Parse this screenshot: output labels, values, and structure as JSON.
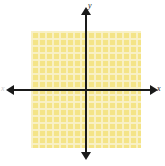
{
  "figure": {
    "title": "",
    "background_color": "#ffffff"
  },
  "axes": {
    "x_label": "x",
    "y_label": "y",
    "x_label_secondary": "x",
    "axis_color": "#1a1a1a",
    "origin_x_px": 86,
    "origin_y_px": 90
  },
  "grid": {
    "cell_size_px": 7,
    "columns": 16,
    "rows": 17,
    "fill_color": "#f7ec9a",
    "line_color": "#ffffff",
    "left_px": 31,
    "top_px": 31,
    "width_px": 110,
    "height_px": 117
  },
  "chart_data": {
    "type": "scatter",
    "title": "",
    "xlabel": "x",
    "ylabel": "y",
    "series": [],
    "x": [],
    "values": [],
    "xlim": [
      -8,
      8
    ],
    "ylim": [
      -9,
      8
    ],
    "grid": true,
    "legend": "none",
    "annotations": []
  }
}
